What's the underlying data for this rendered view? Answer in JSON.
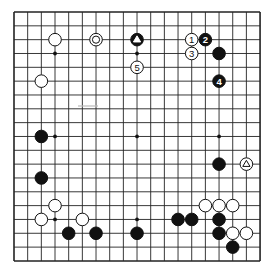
{
  "board": {
    "size": 19,
    "origin_x": 14,
    "origin_y": 12,
    "spacing_x": 13.67,
    "spacing_y": 13.83,
    "line_color": "#222222",
    "background": "#ffffff",
    "hoshi": [
      [
        3,
        3
      ],
      [
        9,
        3
      ],
      [
        15,
        3
      ],
      [
        3,
        9
      ],
      [
        9,
        9
      ],
      [
        15,
        9
      ],
      [
        3,
        15
      ],
      [
        9,
        15
      ],
      [
        15,
        15
      ]
    ]
  },
  "stones": [
    {
      "color": "white",
      "col": 3,
      "row": 2
    },
    {
      "color": "white",
      "col": 6,
      "row": 2,
      "mark": "circle"
    },
    {
      "color": "black",
      "col": 9,
      "row": 2,
      "mark": "triangle"
    },
    {
      "color": "white",
      "col": 13,
      "row": 2,
      "label": "1"
    },
    {
      "color": "black",
      "col": 14,
      "row": 2,
      "label": "2"
    },
    {
      "color": "white",
      "col": 13,
      "row": 3,
      "label": "3"
    },
    {
      "color": "black",
      "col": 15,
      "row": 3
    },
    {
      "color": "white",
      "col": 9,
      "row": 4,
      "label": "5"
    },
    {
      "color": "black",
      "col": 15,
      "row": 5,
      "label": "4"
    },
    {
      "color": "white",
      "col": 2,
      "row": 5
    },
    {
      "color": "black",
      "col": 2,
      "row": 9
    },
    {
      "color": "black",
      "col": 2,
      "row": 12
    },
    {
      "color": "black",
      "col": 15,
      "row": 11
    },
    {
      "color": "white",
      "col": 17,
      "row": 11,
      "mark": "triangle"
    },
    {
      "color": "white",
      "col": 3,
      "row": 14
    },
    {
      "color": "white",
      "col": 2,
      "row": 15
    },
    {
      "color": "white",
      "col": 5,
      "row": 15
    },
    {
      "color": "black",
      "col": 4,
      "row": 16
    },
    {
      "color": "black",
      "col": 6,
      "row": 16
    },
    {
      "color": "black",
      "col": 9,
      "row": 16
    },
    {
      "color": "white",
      "col": 14,
      "row": 14
    },
    {
      "color": "white",
      "col": 15,
      "row": 14
    },
    {
      "color": "white",
      "col": 16,
      "row": 14
    },
    {
      "color": "black",
      "col": 12,
      "row": 15
    },
    {
      "color": "black",
      "col": 13,
      "row": 15
    },
    {
      "color": "black",
      "col": 15,
      "row": 15
    },
    {
      "color": "black",
      "col": 15,
      "row": 16
    },
    {
      "color": "white",
      "col": 16,
      "row": 16
    },
    {
      "color": "white",
      "col": 17,
      "row": 16
    },
    {
      "color": "black",
      "col": 16,
      "row": 17
    }
  ]
}
